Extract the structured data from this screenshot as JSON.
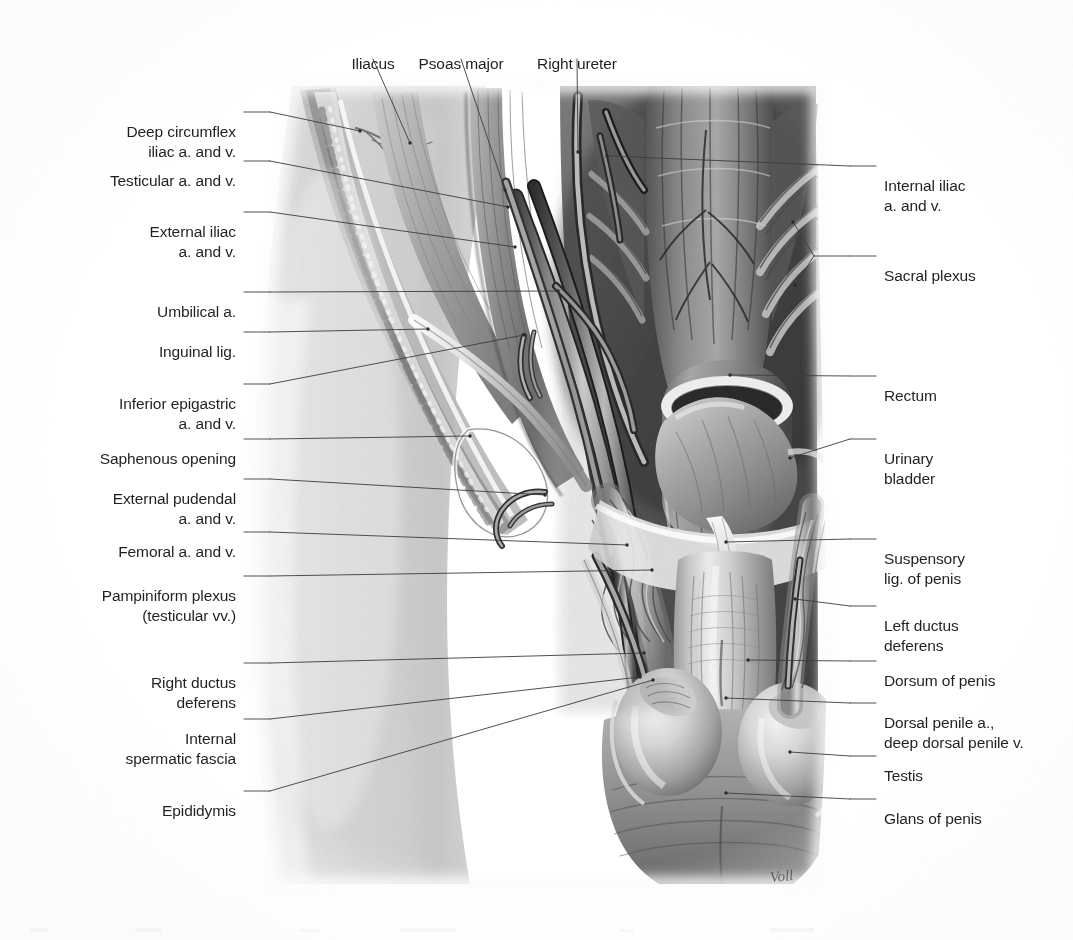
{
  "figure": {
    "kind": "anatomical-illustration",
    "rendering": "graphite / grayscale medical illustration",
    "artist_signature": "Voll",
    "palette": {
      "background": "#ffffff",
      "label_text": "#231f20",
      "leader_line": "#3c3c3c",
      "tissue_light": "#dcdcdc",
      "tissue_mid": "#9a9a9a",
      "tissue_dark": "#4e4e4e",
      "tissue_deep": "#2b2b2b"
    }
  },
  "labels_top": [
    {
      "id": "iliacus",
      "text": "Iliacus",
      "x": 373,
      "y": 33,
      "tip_x": 410,
      "tip_y": 143
    },
    {
      "id": "psoas-major",
      "text": "Psoas major",
      "x": 461,
      "y": 33,
      "tip_x": 505,
      "tip_y": 190
    },
    {
      "id": "right-ureter",
      "text": "Right ureter",
      "x": 577,
      "y": 33,
      "tip_x": 578,
      "tip_y": 152
    }
  ],
  "labels_left": [
    {
      "id": "deep-circumflex-iliac",
      "text": "Deep circumflex\niliac a. and v.",
      "x": 236,
      "y": 101,
      "tip_x": 360,
      "tip_y": 131
    },
    {
      "id": "testicular-a-v",
      "text": "Testicular a. and v.",
      "x": 236,
      "y": 150,
      "tip_x": 508,
      "tip_y": 207
    },
    {
      "id": "external-iliac-a-v",
      "text": "External iliac\na. and v.",
      "x": 236,
      "y": 201,
      "tip_x": 515,
      "tip_y": 247
    },
    {
      "id": "umbilical-a",
      "text": "Umbilical a.",
      "x": 236,
      "y": 281,
      "tip_x": 558,
      "tip_y": 291
    },
    {
      "id": "inguinal-lig",
      "text": "Inguinal lig.",
      "x": 236,
      "y": 321,
      "tip_x": 428,
      "tip_y": 329
    },
    {
      "id": "inferior-epigastric",
      "text": "Inferior epigastric\na. and v.",
      "x": 236,
      "y": 373,
      "tip_x": 524,
      "tip_y": 335
    },
    {
      "id": "saphenous-opening",
      "text": "Saphenous opening",
      "x": 236,
      "y": 428,
      "tip_x": 470,
      "tip_y": 436
    },
    {
      "id": "external-pudendal",
      "text": "External pudendal\na. and v.",
      "x": 236,
      "y": 468,
      "tip_x": 545,
      "tip_y": 495
    },
    {
      "id": "femoral-a-v",
      "text": "Femoral a. and v.",
      "x": 236,
      "y": 521,
      "tip_x": 627,
      "tip_y": 545
    },
    {
      "id": "pampiniform-plexus",
      "text": "Pampiniform plexus\n(testicular vv.)",
      "x": 236,
      "y": 565,
      "tip_x": 652,
      "tip_y": 570
    },
    {
      "id": "right-ductus-deferens",
      "text": "Right ductus\ndeferens",
      "x": 236,
      "y": 652,
      "tip_x": 644,
      "tip_y": 653
    },
    {
      "id": "internal-spermatic-fascia",
      "text": "Internal\nspermatic fascia",
      "x": 236,
      "y": 708,
      "tip_x": 640,
      "tip_y": 677
    },
    {
      "id": "epididymis",
      "text": "Epididymis",
      "x": 236,
      "y": 780,
      "tip_x": 653,
      "tip_y": 680
    }
  ],
  "labels_right": [
    {
      "id": "internal-iliac-a-v",
      "text": "Internal iliac\na. and v.",
      "x": 884,
      "y": 155,
      "tip_x": 607,
      "tip_y": 156
    },
    {
      "id": "sacral-plexus",
      "text": "Sacral plexus",
      "x": 884,
      "y": 245,
      "tip_x": 793,
      "tip_y": 222,
      "tip2_x": 795,
      "tip2_y": 285
    },
    {
      "id": "rectum",
      "text": "Rectum",
      "x": 884,
      "y": 365,
      "tip_x": 730,
      "tip_y": 375
    },
    {
      "id": "urinary-bladder",
      "text": "Urinary\nbladder",
      "x": 884,
      "y": 428,
      "tip_x": 790,
      "tip_y": 458
    },
    {
      "id": "suspensory-lig-penis",
      "text": "Suspensory\nlig. of penis",
      "x": 884,
      "y": 528,
      "tip_x": 726,
      "tip_y": 542
    },
    {
      "id": "left-ductus-deferens",
      "text": "Left ductus\ndeferens",
      "x": 884,
      "y": 595,
      "tip_x": 795,
      "tip_y": 599
    },
    {
      "id": "dorsum-of-penis",
      "text": "Dorsum of penis",
      "x": 884,
      "y": 650,
      "tip_x": 748,
      "tip_y": 660
    },
    {
      "id": "dorsal-penile-vessels",
      "text": "Dorsal penile a.,\ndeep dorsal penile v.",
      "x": 884,
      "y": 692,
      "tip_x": 726,
      "tip_y": 698
    },
    {
      "id": "testis",
      "text": "Testis",
      "x": 884,
      "y": 745,
      "tip_x": 790,
      "tip_y": 752
    },
    {
      "id": "glans-of-penis",
      "text": "Glans of penis",
      "x": 884,
      "y": 788,
      "tip_x": 726,
      "tip_y": 793
    }
  ],
  "leader_geometry": {
    "left_stub_x": 288,
    "right_stub_x": 872,
    "stub_length": 26,
    "line_width": 0.9
  }
}
